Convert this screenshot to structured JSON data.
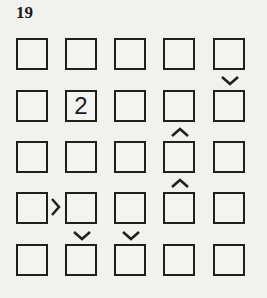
{
  "puzzle": {
    "number": "19",
    "type": "futoshiki",
    "size": 5,
    "grid": [
      [
        "",
        "",
        "",
        "",
        ""
      ],
      [
        "",
        "2",
        "",
        "",
        ""
      ],
      [
        "",
        "",
        "",
        "",
        ""
      ],
      [
        "",
        "",
        "",
        "",
        ""
      ],
      [
        "",
        "",
        "",
        "",
        ""
      ]
    ],
    "constraints": [
      {
        "between": [
          [
            1,
            5
          ],
          [
            2,
            5
          ]
        ],
        "symbol": "v",
        "meaning": "top > bottom"
      },
      {
        "between": [
          [
            2,
            4
          ],
          [
            3,
            4
          ]
        ],
        "symbol": "^",
        "meaning": "top < bottom"
      },
      {
        "between": [
          [
            3,
            4
          ],
          [
            4,
            4
          ]
        ],
        "symbol": "^",
        "meaning": "top < bottom"
      },
      {
        "between": [
          [
            4,
            1
          ],
          [
            4,
            2
          ]
        ],
        "symbol": ">",
        "meaning": "left > right"
      },
      {
        "between": [
          [
            4,
            2
          ],
          [
            5,
            2
          ]
        ],
        "symbol": "v",
        "meaning": "top > bottom"
      },
      {
        "between": [
          [
            4,
            3
          ],
          [
            5,
            3
          ]
        ],
        "symbol": "v",
        "meaning": "top > bottom"
      }
    ]
  }
}
